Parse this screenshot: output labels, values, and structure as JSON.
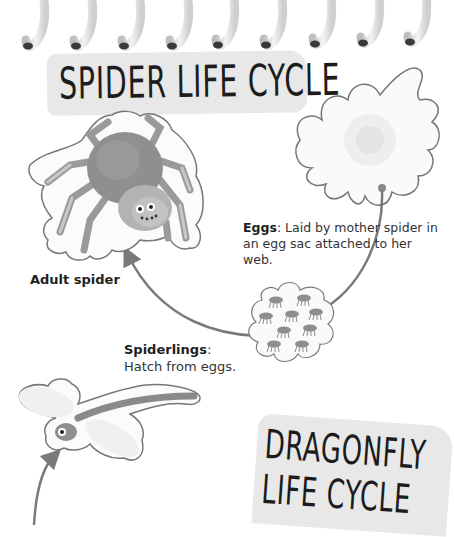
{
  "page": {
    "type": "book-spread",
    "binding": "spiral",
    "coil_count": 9
  },
  "spider_section": {
    "title": "SPIDER LIFE CYCLE",
    "stages": [
      {
        "id": "eggs",
        "label": "Eggs",
        "separator": ": ",
        "description": "Laid by mother spider in an egg sac attached to her web.",
        "illustration": "egg-sac-icon"
      },
      {
        "id": "spiderlings",
        "label": "Spiderlings",
        "separator": ":",
        "description": "Hatch from eggs.",
        "illustration": "spiderlings-cluster-icon"
      },
      {
        "id": "adult",
        "label": "Adult spider",
        "description": "",
        "illustration": "spider-icon"
      }
    ]
  },
  "dragonfly_section": {
    "title_line1": "DRAGONFLY",
    "title_line2": "LIFE CYCLE",
    "illustration": "dragonfly-icon"
  },
  "colors": {
    "banner_fill": "#e8e8e8",
    "title_text": "#1c1c1c",
    "body_text": "#333333",
    "arrow": "#7a7a7a",
    "outline": "#777777"
  }
}
